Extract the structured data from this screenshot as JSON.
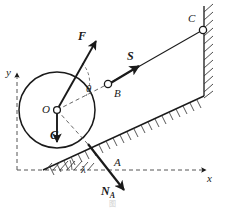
{
  "figure": {
    "title": "",
    "caption": "图",
    "background_color": "#ffffff",
    "stroke_color": "#1a1a1a",
    "width": 225,
    "height": 208
  },
  "axes": {
    "x_label": "x",
    "y_label": "y",
    "style": "dashed",
    "origin_note": "dashed reference axes, arrows at positive ends"
  },
  "points": {
    "O": {
      "label": "O",
      "role": "wheel-center"
    },
    "A": {
      "label": "A",
      "role": "contact-point-on-incline"
    },
    "B": {
      "label": "B",
      "role": "pin-joint-on-wheel"
    },
    "C": {
      "label": "C",
      "role": "pin-joint-on-wall"
    }
  },
  "vectors": {
    "F": {
      "label": "F",
      "description": "applied force through O, directed up-right"
    },
    "G": {
      "label": "G",
      "description": "weight at O, directed straight down"
    },
    "S": {
      "label": "S",
      "description": "rod force along BC, directed up-right"
    },
    "N": {
      "label": "N",
      "subscript": "A",
      "description": "normal reaction at A, directed down-right"
    }
  },
  "angles": {
    "theta": {
      "label": "θ",
      "description": "angle between F line and line OB"
    },
    "lambda": {
      "label": "λ",
      "description": "incline angle above horizontal"
    }
  },
  "bodies": {
    "wheel": {
      "name": "wheel",
      "shape": "circle"
    },
    "incline": {
      "name": "inclined-surface",
      "hatched": true
    },
    "wall": {
      "name": "vertical-wall",
      "hatched": true
    },
    "rod": {
      "name": "rod-BC"
    }
  },
  "colors": {
    "ink": "#1a1a1a",
    "paper": "#ffffff",
    "hatch": "#3a3a3a",
    "dash": "#555555"
  }
}
